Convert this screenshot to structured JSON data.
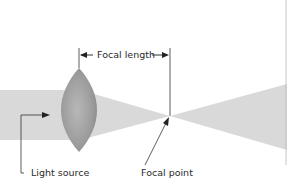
{
  "diagram": {
    "labels": {
      "focal_length": "Focal length",
      "light_source": "Light source",
      "focal_point": "Focal point"
    },
    "colors": {
      "beam": "#d8d8d8",
      "lens": "#9a9a9a",
      "line": "#333333"
    }
  }
}
